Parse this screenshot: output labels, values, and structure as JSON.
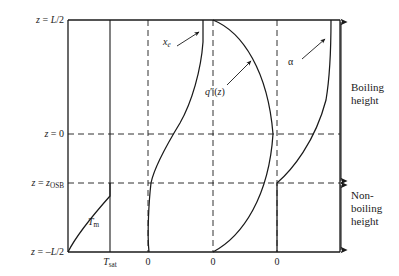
{
  "figure": {
    "type": "schematic-diagram",
    "frame": {
      "left": 68,
      "right": 340,
      "top": 20,
      "bottom": 252
    },
    "background": "#ffffff",
    "line_color": "#1a1a1a"
  },
  "y_axis": {
    "ticks": [
      {
        "label_html": "<span class=\"it\">z</span> = <span class=\"it\">L</span>/2",
        "plain": "z = L/2",
        "y": 20,
        "dashed": false
      },
      {
        "label_html": "<span class=\"it\">z</span> = 0",
        "plain": "z = 0",
        "y": 134,
        "dashed": true
      },
      {
        "label_html": "<span class=\"it\">z</span> = <span class=\"it\">z</span><span class=\"sub\">OSB</span>",
        "plain": "z = zOSB",
        "y": 183,
        "dashed": true
      },
      {
        "label_html": "<span class=\"it\">z</span> = –<span class=\"it\">L</span>/2",
        "plain": "z = -L/2",
        "y": 252,
        "dashed": false
      }
    ]
  },
  "x_axis": {
    "ticks": [
      {
        "label_html": "<span class=\"it\">T</span><span class=\"sub\">sat</span>",
        "plain": "Tsat",
        "x": 110,
        "line": "solid"
      },
      {
        "label_html": "0",
        "plain": "0",
        "x": 148,
        "line": "dashed"
      },
      {
        "label_html": "0",
        "plain": "0",
        "x": 213,
        "line": "dashed"
      },
      {
        "label_html": "0",
        "plain": "0",
        "x": 277,
        "line": "dashed"
      }
    ]
  },
  "curves": [
    {
      "name": "moderator-temperature",
      "label_html": "<span class=\"it\">T</span><span class=\"sub\">m</span>",
      "plain": "Tm",
      "label_x": 88,
      "label_y": 222,
      "description": "Rises from bottom-left corner, concave-down, meeting the Tsat line at z = zOSB, then vertical (saturated) above zOSB",
      "points": [
        [
          68,
          252
        ],
        [
          72,
          240
        ],
        [
          78,
          226
        ],
        [
          86,
          213
        ],
        [
          96,
          201
        ],
        [
          105,
          191
        ],
        [
          110,
          183
        ],
        [
          110,
          134
        ],
        [
          110,
          20
        ]
      ]
    },
    {
      "name": "equilibrium-quality",
      "label_html": "<span class=\"it\">x</span><span class=\"sub-it\">e</span>",
      "plain": "xe",
      "label_x": 165,
      "label_y": 42,
      "has_arrow": true,
      "arrow": {
        "from_x": 176,
        "from_y": 47,
        "to_x": 199,
        "to_y": 33
      },
      "description": "Negative below zOSB, crosses zero at zOSB, rises with S-shape to maximum at top of channel",
      "points": [
        [
          149,
          252
        ],
        [
          148,
          235
        ],
        [
          149,
          215
        ],
        [
          150,
          198
        ],
        [
          151,
          183
        ],
        [
          155,
          170
        ],
        [
          162,
          155
        ],
        [
          170,
          140
        ],
        [
          179,
          125
        ],
        [
          187,
          110
        ],
        [
          194,
          93
        ],
        [
          199,
          73
        ],
        [
          202,
          52
        ],
        [
          203,
          32
        ],
        [
          203,
          20
        ]
      ]
    },
    {
      "name": "heat-flux",
      "label_html": "<span class=\"it\">q</span>″(<span class=\"it\">z</span>)",
      "plain": "q″(z)",
      "label_x": 206,
      "label_y": 92,
      "has_arrow": true,
      "arrow": {
        "from_x": 226,
        "from_y": 85,
        "to_x": 250,
        "to_y": 62
      },
      "description": "Cosine-shaped axial heat flux, zero at both ends, peak near channel mid-plane",
      "points": [
        [
          213,
          20
        ],
        [
          226,
          27
        ],
        [
          240,
          38
        ],
        [
          252,
          53
        ],
        [
          261,
          71
        ],
        [
          268,
          92
        ],
        [
          272,
          115
        ],
        [
          273,
          134
        ],
        [
          272,
          155
        ],
        [
          268,
          176
        ],
        [
          262,
          195
        ],
        [
          254,
          213
        ],
        [
          243,
          230
        ],
        [
          230,
          243
        ],
        [
          216,
          250
        ],
        [
          213,
          252
        ]
      ]
    },
    {
      "name": "heat-transfer-coefficient",
      "label_html": "α",
      "plain": "alpha",
      "label_x": 290,
      "label_y": 62,
      "has_arrow": true,
      "arrow": {
        "from_x": 301,
        "from_y": 60,
        "to_x": 324,
        "to_y": 40
      },
      "description": "Constant (zero offset) below zOSB, then rises sharply after onset of subcooled boiling up to the channel exit",
      "points": [
        [
          277,
          252
        ],
        [
          277,
          215
        ],
        [
          277,
          195
        ],
        [
          277,
          183
        ],
        [
          284,
          175
        ],
        [
          293,
          166
        ],
        [
          302,
          155
        ],
        [
          310,
          142
        ],
        [
          317,
          127
        ],
        [
          323,
          110
        ],
        [
          327,
          90
        ],
        [
          330,
          66
        ],
        [
          331,
          42
        ],
        [
          331,
          20
        ]
      ]
    }
  ],
  "brackets": [
    {
      "name": "boiling-height",
      "label_lines": [
        "Boiling",
        "height"
      ],
      "x": 341,
      "top": 20,
      "bottom": 183,
      "label_x": 352,
      "label_y": 88
    },
    {
      "name": "non-boiling-height",
      "label_lines": [
        "Non-",
        "boiling",
        "height"
      ],
      "x": 341,
      "top": 183,
      "bottom": 252,
      "label_x": 352,
      "label_y": 194
    }
  ]
}
